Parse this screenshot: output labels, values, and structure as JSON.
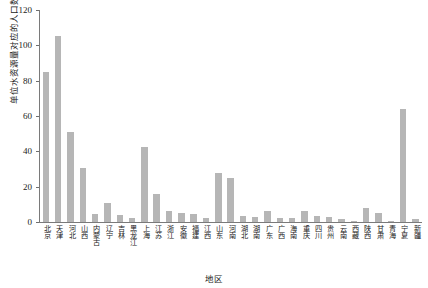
{
  "chart_data": {
    "type": "bar",
    "title": "",
    "xlabel": "地区",
    "ylabel": "单位水资源量对应的人口数量(人/万m³)",
    "ylim": [
      0,
      120
    ],
    "yticks": [
      0,
      20,
      40,
      60,
      80,
      100,
      120
    ],
    "grid": false,
    "legend": null,
    "bar_color": "#b6b6b6",
    "axis_color": "#7a7a7a",
    "categories": [
      "北京",
      "天津",
      "河北",
      "山西",
      "内蒙古",
      "辽宁",
      "吉林",
      "黑龙江",
      "上海",
      "江苏",
      "浙江",
      "安徽",
      "福建",
      "江西",
      "山东",
      "河南",
      "湖北",
      "湖南",
      "广东",
      "广西",
      "海南",
      "重庆",
      "四川",
      "贵州",
      "云南",
      "西藏",
      "陕西",
      "甘肃",
      "青海",
      "宁夏",
      "新疆"
    ],
    "values": [
      85.0,
      105.5,
      51.0,
      30.5,
      4.5,
      11.0,
      4.0,
      2.0,
      42.5,
      16.0,
      6.0,
      5.0,
      4.5,
      2.5,
      28.0,
      25.0,
      3.5,
      3.0,
      6.5,
      2.5,
      2.5,
      6.0,
      3.5,
      3.0,
      1.5,
      0.3,
      8.0,
      5.0,
      0.6,
      64.0,
      1.5
    ]
  }
}
